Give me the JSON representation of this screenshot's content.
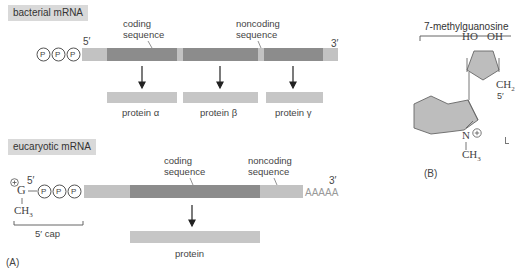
{
  "panel_a": {
    "panel_label": "(A)",
    "bacterial": {
      "title": "bacterial mRNA",
      "five_prime": "5′",
      "three_prime": "3′",
      "phosphates": [
        "P",
        "P",
        "P"
      ],
      "coding_label_line1": "coding",
      "coding_label_line2": "sequence",
      "noncoding_label_line1": "noncoding",
      "noncoding_label_line2": "sequence",
      "proteins": [
        "protein α",
        "protein β",
        "protein γ"
      ]
    },
    "eucaryotic": {
      "title": "eucaryotic mRNA",
      "five_prime": "5′",
      "three_prime": "3′",
      "charge": "+",
      "guanine": "G",
      "methyl": "CH",
      "methyl_sub": "3",
      "phosphates": [
        "P",
        "P",
        "P"
      ],
      "cap_label": "5′ cap",
      "coding_label_line1": "coding",
      "coding_label_line2": "sequence",
      "noncoding_label_line1": "noncoding",
      "noncoding_label_line2": "sequence",
      "poly_a": "AAAAA",
      "protein": "protein"
    }
  },
  "panel_b": {
    "panel_label": "(B)",
    "title": "7-methylguanosine",
    "ho": "HO",
    "oh": "OH",
    "ch2": "CH",
    "ch2_sub": "2",
    "five_prime": "5′",
    "nitrogen": "N",
    "charge": "+",
    "methyl": "CH",
    "methyl_sub": "3"
  },
  "colors": {
    "light_segment": "#c2c2c2",
    "dark_segment": "#8c8c8c",
    "protein_box": "#c6c6c6",
    "label_box": "#d9d9d9",
    "ring_fill": "#bdbdbd"
  }
}
